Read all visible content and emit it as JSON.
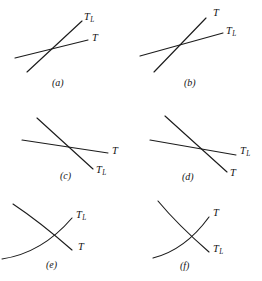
{
  "figure": {
    "background_color": "#ffffff",
    "line_color": "#1c1c1c",
    "label_T": "T",
    "label_TL_base": "T",
    "label_TL_sub": "L"
  },
  "panels": [
    {
      "id": "a",
      "caption": "(a)",
      "caption_x": 52,
      "caption_y": 78,
      "curves": [
        {
          "name": "steep-rising-line",
          "label": "TL",
          "label_x": 84,
          "label_y": 12,
          "path": "M 27 72 L 82 21"
        },
        {
          "name": "shallow-rising-line",
          "label": "T",
          "label_x": 92,
          "label_y": 33,
          "path": "M 15 58 L 88 40"
        }
      ]
    },
    {
      "id": "b",
      "caption": "(b)",
      "caption_x": 184,
      "caption_y": 78,
      "curves": [
        {
          "name": "steep-rising-line",
          "label": "T",
          "label_x": 82,
          "label_y": 8,
          "path": "M 23 72 L 75 18"
        },
        {
          "name": "shallow-rising-line",
          "label": "TL",
          "label_x": 95,
          "label_y": 26,
          "path": "M 9 56 L 92 33"
        }
      ]
    },
    {
      "id": "c",
      "caption": "(c)",
      "caption_x": 60,
      "caption_y": 171,
      "curves": [
        {
          "name": "steep-falling-line",
          "label": "TL",
          "label_x": 96,
          "label_y": 71,
          "path": "M 37 24 L 93 75"
        },
        {
          "name": "shallow-falling-line",
          "label": "T",
          "label_x": 112,
          "label_y": 52,
          "path": "M 22 46 L 108 59"
        }
      ]
    },
    {
      "id": "d",
      "caption": "(d)",
      "caption_x": 182,
      "caption_y": 172,
      "curves": [
        {
          "name": "steep-falling-line",
          "label": "T",
          "label_x": 99,
          "label_y": 74,
          "path": "M 34 22 L 96 78"
        },
        {
          "name": "shallow-falling-line",
          "label": "TL",
          "label_x": 109,
          "label_y": 52,
          "path": "M 19 46 L 105 61"
        }
      ]
    },
    {
      "id": "e",
      "caption": "(e)",
      "caption_x": 46,
      "caption_y": 260,
      "curves": [
        {
          "name": "rising-curve",
          "label": "TL",
          "label_x": 76,
          "label_y": 22,
          "path": "M 2 71 Q 42 65 72 30"
        },
        {
          "name": "falling-curve",
          "label": "T",
          "label_x": 78,
          "label_y": 54,
          "path": "M 13 16 Q 40 34 72 62"
        }
      ]
    },
    {
      "id": "f",
      "caption": "(f)",
      "caption_x": 180,
      "caption_y": 261,
      "curves": [
        {
          "name": "rising-curve",
          "label": "T",
          "label_x": 82,
          "label_y": 20,
          "path": "M 22 70 Q 54 62 78 29"
        },
        {
          "name": "falling-curve",
          "label": "TL",
          "label_x": 82,
          "label_y": 56,
          "path": "M 27 13 Q 46 36 78 64"
        }
      ]
    }
  ]
}
